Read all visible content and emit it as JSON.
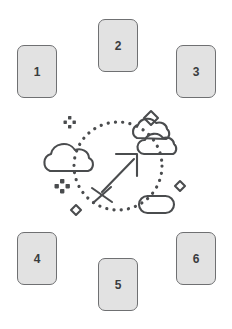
{
  "canvas": {
    "width": 232,
    "height": 329,
    "background_color": "#ffffff"
  },
  "theme": {
    "card_fill": "#e2e2e2",
    "card_stroke": "#6f7072",
    "card_text": "#3a3c3e",
    "illustration_stroke": "#4a4c4e",
    "dot_color": "#4a4c4e"
  },
  "cards": [
    {
      "id": "card-1",
      "label": "1",
      "position": "top-left"
    },
    {
      "id": "card-2",
      "label": "2",
      "position": "top-center"
    },
    {
      "id": "card-3",
      "label": "3",
      "position": "top-right"
    },
    {
      "id": "card-4",
      "label": "4",
      "position": "bottom-left"
    },
    {
      "id": "card-5",
      "label": "5",
      "position": "bottom-center"
    },
    {
      "id": "card-6",
      "label": "6",
      "position": "bottom-right"
    }
  ],
  "illustration": {
    "name": "sagittarius-arrow-illustration",
    "center_glyph": "sagittarius-arrow",
    "dotted_circle": true,
    "decorations": [
      {
        "name": "cloud-left",
        "type": "cloud"
      },
      {
        "name": "cloud-right",
        "type": "double-cloud"
      },
      {
        "name": "pill-bottom",
        "type": "capsule"
      },
      {
        "name": "diamond-top",
        "type": "diamond"
      },
      {
        "name": "diamond-right",
        "type": "diamond"
      },
      {
        "name": "diamond-bottom-left",
        "type": "diamond"
      },
      {
        "name": "sparkle-top-left",
        "type": "four-dot-sparkle"
      },
      {
        "name": "sparkle-bottom-left",
        "type": "four-dot-sparkle"
      }
    ]
  }
}
